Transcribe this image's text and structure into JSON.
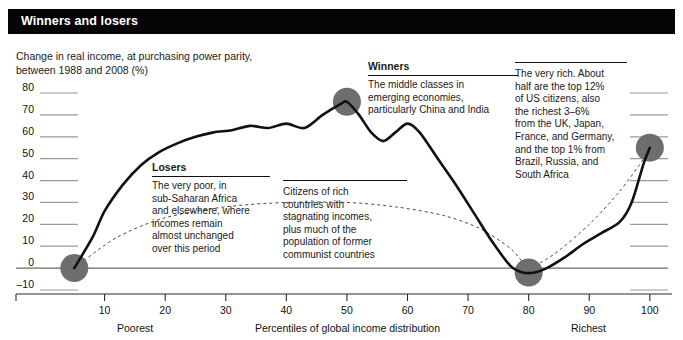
{
  "header": {
    "title": "Winners and losers"
  },
  "subtitle": "Change in real income, at purchasing power parity,\nbetween 1988 and 2008 (%)",
  "annotations": {
    "winners": {
      "heading": "Winners",
      "body": "The middle classes in\nemerging economies,\nparticularly China and India"
    },
    "losers": {
      "heading": "Losers",
      "body": "The very poor, in\nsub-Saharan Africa\nand elsewhere, where\nincomes remain\nalmost unchanged\nover this period"
    },
    "stagnating": {
      "heading": "",
      "body": "Citizens of rich\ncountries with\nstagnating incomes,\nplus much of the\npopulation of former\ncommunist countries"
    },
    "veryrich": {
      "heading": "",
      "body": "The very rich. About\nhalf are the top 12%\nof US citizens, also\nthe richest 3–6%\nfrom the UK, Japan,\nFrance, and Germany,\nand the top 1% from\nBrazil, Russia, and\nSouth Africa"
    }
  },
  "chart_data": {
    "type": "line",
    "title": "Winners and losers",
    "subtitle": "Change in real income, at purchasing power parity, between 1988 and 2008 (%)",
    "xlabel": "Percentiles of global income distribution",
    "ylabel": "Change in real income (%)",
    "xlim": [
      0,
      103
    ],
    "ylim": [
      -13,
      84
    ],
    "xticks": [
      10,
      20,
      30,
      40,
      50,
      60,
      70,
      80,
      90,
      100
    ],
    "yticks": [
      -10,
      0,
      10,
      20,
      30,
      40,
      50,
      60,
      70,
      80
    ],
    "xtick_labels": [
      "10",
      "20",
      "30",
      "40",
      "50",
      "60",
      "70",
      "80",
      "90",
      "100"
    ],
    "ytick_labels": [
      "-10",
      "0",
      "10",
      "20",
      "30",
      "40",
      "50",
      "60",
      "70",
      "80"
    ],
    "x_axis_caption_left": "Poorest",
    "x_axis_caption_center": "Percentiles of global income distribution",
    "x_axis_caption_right": "Richest",
    "grid": "horizontal-partial",
    "legend": "none",
    "series": [
      {
        "name": "Change in real income 1988-2008",
        "x": [
          5,
          8,
          10,
          13,
          16,
          19,
          22,
          25,
          28,
          31,
          34,
          37,
          40,
          43,
          46,
          49,
          50,
          52,
          54,
          56,
          58,
          60,
          62,
          65,
          68,
          71,
          74,
          77,
          79,
          81,
          83,
          86,
          89,
          92,
          95,
          97,
          99,
          100
        ],
        "y": [
          0,
          14,
          26,
          38,
          47,
          53,
          57,
          60,
          62,
          63,
          65,
          64,
          66,
          64,
          70,
          75,
          76,
          70,
          62,
          58,
          62,
          66,
          62,
          50,
          38,
          25,
          12,
          1,
          -2,
          -2,
          0,
          5,
          11,
          16,
          21,
          30,
          48,
          55
        ]
      }
    ],
    "markers": [
      {
        "label": "poorest-marker",
        "x": 5,
        "y": 0
      },
      {
        "label": "winners-peak-marker",
        "x": 50,
        "y": 76
      },
      {
        "label": "losers-trough-marker",
        "x": 80,
        "y": -2
      },
      {
        "label": "richest-marker",
        "x": 100,
        "y": 55
      }
    ],
    "trend_dashed": "a light dashed reference curve running from the poorest marker, arcing up and over, and descending to the trough marker near the 80th percentile, then rising to the richest marker",
    "colors": {
      "line": "#111111",
      "marker": "#6e6e6e",
      "gridline": "#9a9a9a",
      "zeroline": "#6b6b6b",
      "title_bar": "#050505",
      "title_text": "#ffffff"
    }
  }
}
